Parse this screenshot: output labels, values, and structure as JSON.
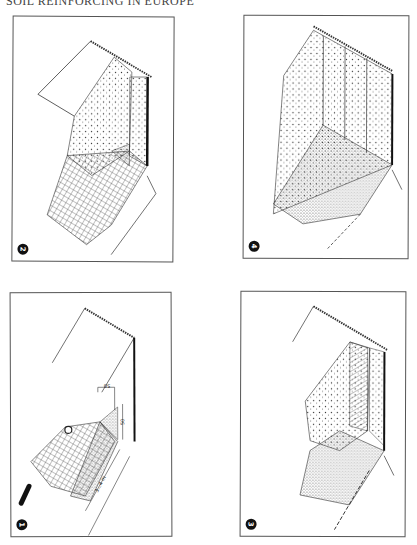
{
  "page": {
    "running_head": "SOIL REINFORCING IN EUROPE"
  },
  "figures": [
    {
      "id": "p2",
      "number": "2",
      "description": "Geogrid wrapped face with fill placed behind, partially completed layer"
    },
    {
      "id": "p4",
      "number": "4",
      "description": "Completed facing with vertical panels and next fill layer placed"
    },
    {
      "id": "p1",
      "number": "1",
      "description": "Geogrid laid out with formwork bag and pipe, dimensioned"
    },
    {
      "id": "p3",
      "number": "3",
      "description": "Fill compacted over geogrid, facing turned up"
    }
  ],
  "dimensions": {
    "top_width": "50",
    "side_height": "50",
    "grid_length": "3...4 m"
  },
  "colors": {
    "ink": "#222222",
    "paper": "#ffffff"
  }
}
